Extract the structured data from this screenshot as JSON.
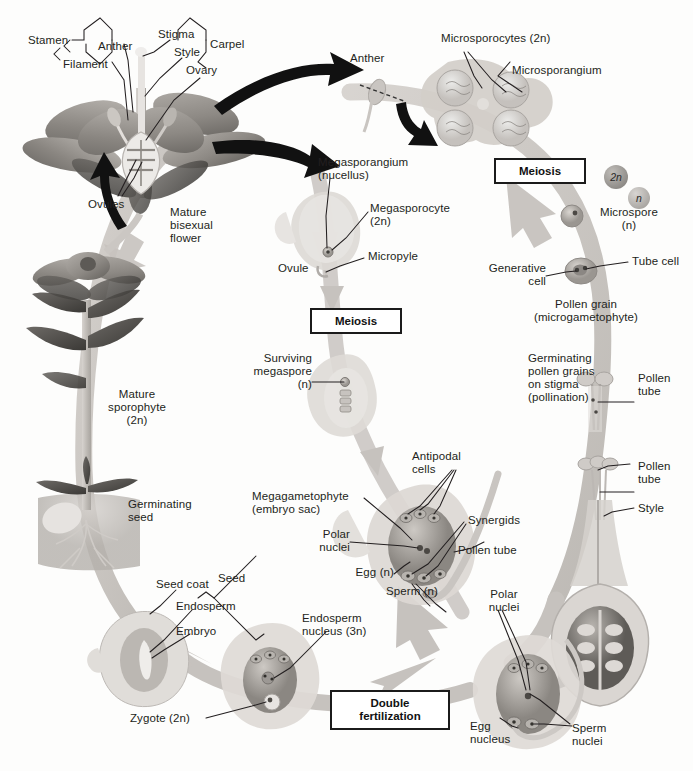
{
  "figure": {
    "colors": {
      "cycle_band": "#c6c2be",
      "cycle_band_light": "#d8d5d1",
      "black_arrow": "#111111",
      "text": "#231f20",
      "box_border": "#1b1b1b",
      "petal_mid": "#9a9691",
      "petal_dark": "#6e6b67",
      "leaf_dark": "#4f4c49",
      "cell_fill": "#b6b2ad",
      "nucleus": "#6f6b67"
    }
  },
  "stage_boxes": [
    {
      "id": "meiosis-top",
      "label": "Meiosis"
    },
    {
      "id": "meiosis-left",
      "label": "Meiosis"
    },
    {
      "id": "double-fert",
      "label": "Double\nfertilization"
    }
  ],
  "ploidy_chips": [
    {
      "id": "chip-2n",
      "label": "2n",
      "tone": "dark"
    },
    {
      "id": "chip-n",
      "label": "n",
      "tone": "light"
    }
  ],
  "labels": {
    "flower": {
      "stamen": "Stamen",
      "anther": "Anther",
      "filament": "Filament",
      "stigma": "Stigma",
      "style": "Style",
      "carpel": "Carpel",
      "ovary": "Ovary",
      "ovules": "Ovules",
      "mature_bisexual_flower": "Mature\nbisexual\nflower"
    },
    "male": {
      "anther": "Anther",
      "microsporocytes": "Microsporocytes (2n)",
      "microsporangium": "Microsporangium",
      "microspore": "Microspore\n(n)",
      "generative_cell": "Generative\ncell",
      "tube_cell": "Tube cell",
      "pollen_grain": "Pollen grain\n(microgametophyte)",
      "germinating_pollen": "Germinating\npollen grains\non stigma\n(pollination)",
      "pollen_tube_upper": "Pollen\ntube",
      "pollen_tube_lower": "Pollen\ntube",
      "style": "Style"
    },
    "female": {
      "megasporangium": "Megasporangium\n(nucellus)",
      "megasporocyte": "Megasporocyte\n(2n)",
      "micropyle": "Micropyle",
      "ovule": "Ovule",
      "surviving_megaspore": "Surviving\nmegaspore\n(n)",
      "megagametophyte": "Megagametophyte\n(embryo sac)",
      "antipodal_cells": "Antipodal\ncells",
      "polar_nuclei": "Polar\nnuclei",
      "synergids": "Synergids",
      "egg": "Egg (n)",
      "pollen_tube": "Pollen tube",
      "sperm": "Sperm (n)"
    },
    "fertilization": {
      "polar_nuclei": "Polar\nnuclei",
      "egg_nucleus": "Egg\nnucleus",
      "sperm_nuclei": "Sperm\nnuclei"
    },
    "seed": {
      "endosperm_nucleus": "Endosperm\nnucleus (3n)",
      "zygote": "Zygote (2n)",
      "seed_coat": "Seed coat",
      "endosperm": "Endosperm",
      "embryo": "Embryo",
      "seed": "Seed"
    },
    "sporophyte": {
      "germinating_seed": "Germinating\nseed",
      "mature_sporophyte": "Mature\nsporophyte\n(2n)"
    }
  }
}
